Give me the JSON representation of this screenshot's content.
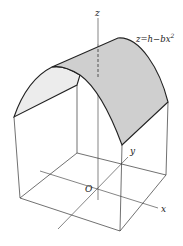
{
  "diagram": {
    "equation": {
      "lhs": "z",
      "rhs": "h−bx",
      "exponent": "2"
    },
    "axes": {
      "z_label": "z",
      "y_label": "y",
      "x_label": "x",
      "origin_label": "O"
    },
    "colors": {
      "line": "#222222",
      "curved_surface_fill": "#cfcfcf",
      "end_face_fill": "#ececec",
      "background": "#ffffff"
    }
  }
}
